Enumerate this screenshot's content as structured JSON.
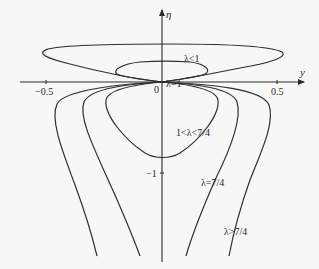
{
  "figure": {
    "axes": {
      "x_label": "y",
      "y_label": "η",
      "origin_label": "0",
      "x_ticks": [
        {
          "value": -0.5,
          "label": "−0.5"
        },
        {
          "value": 0.5,
          "label": "0.5"
        }
      ],
      "y_ticks": [
        {
          "value": -1,
          "label": "−1"
        }
      ]
    },
    "curve_labels": {
      "lambda_lt_1": "λ<1",
      "lambda_eq_1": "λ=1",
      "lambda_between": "1<λ<7/4",
      "lambda_eq_7_4": "λ=7/4",
      "lambda_gt_7_4": "λ>7/4"
    },
    "curves": [
      {
        "name": "λ<1 (outer loop)",
        "shape": "closed loop above axis through origin"
      },
      {
        "name": "λ<1 (inner loop)",
        "shape": "closed loop above axis through origin"
      },
      {
        "name": "λ=1",
        "shape": "degenerate point at origin"
      },
      {
        "name": "1<λ<7/4",
        "shape": "closed loop below axis through origin, bottom near η≈-0.85"
      },
      {
        "name": "λ=7/4",
        "shape": "two open branches from origin extending downward"
      },
      {
        "name": "λ>7/4",
        "shape": "two open branches from origin extending downward, wider"
      }
    ],
    "colors": {
      "background": "#f7f7f5",
      "ink": "#2a2a2a"
    }
  }
}
